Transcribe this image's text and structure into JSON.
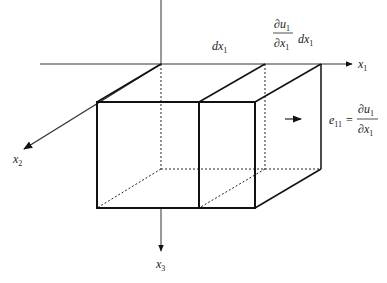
{
  "diagram": {
    "axes": {
      "x1": {
        "label": "x",
        "subscript": "1"
      },
      "x2": {
        "label": "x",
        "subscript": "2"
      },
      "x3": {
        "label": "x",
        "subscript": "3"
      }
    },
    "dimension_labels": {
      "dx1": {
        "d": "dx",
        "subscript": "1"
      },
      "deformation": {
        "numerator": "∂u",
        "numerator_sub": "1",
        "denominator": "∂x",
        "denominator_sub": "1",
        "suffix": "dx",
        "suffix_sub": "1"
      }
    },
    "equation": {
      "lhs": "e",
      "lhs_sub": "11",
      "equals": "=",
      "numerator": "∂u",
      "numerator_sub": "1",
      "denominator": "∂x",
      "denominator_sub": "1"
    },
    "colors": {
      "line": "#111111",
      "background": "#ffffff"
    }
  }
}
